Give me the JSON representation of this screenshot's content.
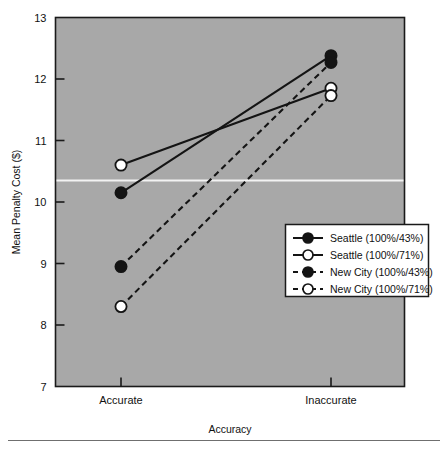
{
  "figure": {
    "background_color": "#ffffff",
    "plot_background_color": "#a8a8a8",
    "plot_border_color": "#1a1a1a",
    "series_color": "#141414",
    "reference_line_color": "#f2f2f2",
    "has_bottom_rule": true
  },
  "axes": {
    "y_label": "Mean Penalty Cost ($)",
    "x_label": "Accuracy",
    "y_ticks": [
      "13",
      "12",
      "11",
      "10",
      "9",
      "8",
      "7"
    ],
    "y_tick_values": [
      13,
      12,
      11,
      10,
      9,
      8,
      7
    ],
    "x_ticks": [
      "Accurate",
      "Inaccurate"
    ]
  },
  "legend": {
    "entries": [
      {
        "label": "Seattle (100%/43%)",
        "marker": "filled-circle",
        "line": "solid"
      },
      {
        "label": "Seattle (100%/71%)",
        "marker": "open-circle",
        "line": "solid"
      },
      {
        "label": "New City (100%/43%)",
        "marker": "filled-circle",
        "line": "dashed"
      },
      {
        "label": "New City (100%/71%)",
        "marker": "open-circle",
        "line": "dashed"
      }
    ]
  },
  "chart_data": {
    "type": "line",
    "title": "",
    "xlabel": "Accuracy",
    "ylabel": "Mean Penalty Cost ($)",
    "categories": [
      "Accurate",
      "Inaccurate"
    ],
    "ylim": [
      7,
      13
    ],
    "yticks": [
      7,
      8,
      9,
      10,
      11,
      12,
      13
    ],
    "grid": false,
    "legend_position": "lower right",
    "reference_line_y": 10.35,
    "series": [
      {
        "name": "Seattle (100%/43%)",
        "values": [
          10.15,
          12.38
        ],
        "marker": "filled-circle",
        "line": "solid"
      },
      {
        "name": "Seattle (100%/71%)",
        "values": [
          10.6,
          11.85
        ],
        "marker": "open-circle",
        "line": "solid"
      },
      {
        "name": "New City (100%/43%)",
        "values": [
          8.95,
          12.27
        ],
        "marker": "filled-circle",
        "line": "dashed"
      },
      {
        "name": "New City (100%/71%)",
        "values": [
          8.3,
          11.73
        ],
        "marker": "open-circle",
        "line": "dashed"
      }
    ]
  }
}
